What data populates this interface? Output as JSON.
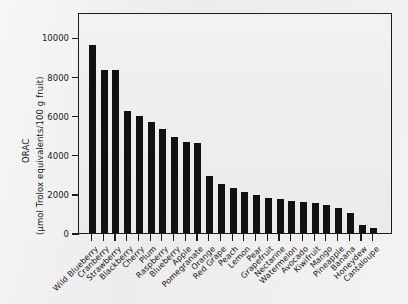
{
  "chart_data": {
    "type": "bar",
    "title": "",
    "subtitle": "",
    "xlabel": "",
    "ylabel_line1": "ORAC",
    "ylabel_line2": "(µmol Trolox equivalents/100 g fruit)",
    "ylim": [
      0,
      11300
    ],
    "ytick_values": [
      0,
      2000,
      4000,
      6000,
      8000,
      10000
    ],
    "ytick_labels": [
      "0",
      "2000",
      "4000",
      "6000",
      "8000",
      "10000"
    ],
    "grid": false,
    "legend": null,
    "bar_color": "#111111",
    "plot_background": "#eeeeee",
    "figure_background": "#ececec",
    "categories": [
      "Wild Blueberry",
      "Cranberry",
      "Strawberry",
      "Blackberry",
      "Cherry",
      "Plum",
      "Raspberry",
      "Blueberry",
      "Apple",
      "Pomegranate",
      "Orange",
      "Red Grape",
      "Peach",
      "Lemon",
      "Pear",
      "Grapefruit",
      "Nectarine",
      "Watermelon",
      "Avocado",
      "Kiwifruit",
      "Mango",
      "Pineapple",
      "Banana",
      "Honeydew",
      "Cantaloupe"
    ],
    "values": [
      9620,
      8350,
      8340,
      6250,
      5970,
      5700,
      5330,
      4900,
      4650,
      4580,
      2900,
      2520,
      2300,
      2100,
      1950,
      1800,
      1750,
      1650,
      1600,
      1550,
      1450,
      1300,
      1000,
      400,
      250
    ],
    "series": [
      {
        "name": "ORAC",
        "values": [
          9620,
          8350,
          8340,
          6250,
          5970,
          5700,
          5330,
          4900,
          4650,
          4580,
          2900,
          2520,
          2300,
          2100,
          1950,
          1800,
          1750,
          1650,
          1600,
          1550,
          1450,
          1300,
          1000,
          400,
          250
        ]
      }
    ]
  }
}
